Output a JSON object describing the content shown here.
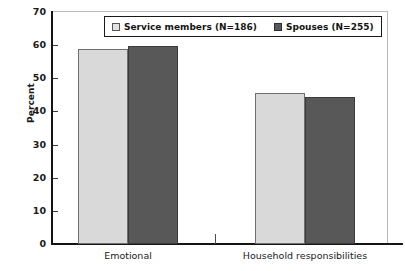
{
  "chart_data": {
    "type": "bar",
    "title": "",
    "xlabel": "",
    "ylabel": "Percent",
    "ylim": [
      0,
      70
    ],
    "yticks": [
      "0",
      "10",
      "20",
      "30",
      "40",
      "50",
      "60",
      "70"
    ],
    "grid": false,
    "legend_position": "top-center",
    "categories": [
      "Emotional",
      "Household responsibilities"
    ],
    "series": [
      {
        "name": "Service members (N=186)",
        "color": "#d9d9d9",
        "values": [
          58.7,
          45.6
        ]
      },
      {
        "name": "Spouses (N=255)",
        "color": "#585858",
        "values": [
          59.8,
          44.4
        ]
      }
    ]
  },
  "legend": {
    "items": [
      {
        "label": "Service members (N=186)",
        "swatch": "light-square-icon"
      },
      {
        "label": "Spouses (N=255)",
        "swatch": "dark-square-icon"
      }
    ]
  }
}
